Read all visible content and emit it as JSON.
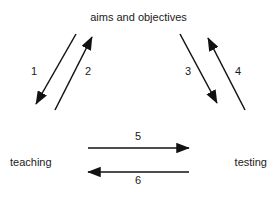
{
  "diagram": {
    "title": "aims and objectives",
    "background_color": "#ffffff",
    "stroke_color": "#121212",
    "text_color": "#1a1a1a",
    "nodes": {
      "top": "aims and objectives",
      "bottom_left": "teaching",
      "bottom_right": "testing"
    },
    "edges": [
      {
        "number": "1",
        "from": "aims and objectives",
        "to": "teaching",
        "direction": "down-left",
        "orientation": "diagonal"
      },
      {
        "number": "2",
        "from": "teaching",
        "to": "aims and objectives",
        "direction": "up-right",
        "orientation": "diagonal"
      },
      {
        "number": "3",
        "from": "aims and objectives",
        "to": "testing",
        "direction": "down-right",
        "orientation": "diagonal"
      },
      {
        "number": "4",
        "from": "testing",
        "to": "aims and objectives",
        "direction": "up-left",
        "orientation": "diagonal"
      },
      {
        "number": "5",
        "from": "teaching",
        "to": "testing",
        "direction": "right",
        "orientation": "horizontal"
      },
      {
        "number": "6",
        "from": "testing",
        "to": "teaching",
        "direction": "left",
        "orientation": "horizontal"
      }
    ]
  }
}
